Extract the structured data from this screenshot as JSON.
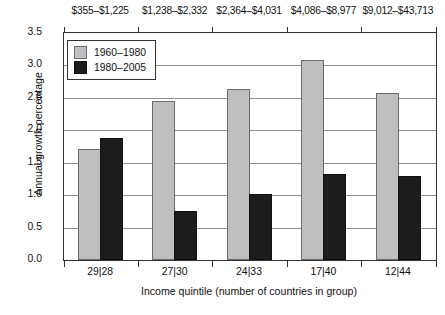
{
  "chart_data": {
    "type": "bar",
    "title": "",
    "xlabel": "Income quintile (number of countries in group)",
    "ylabel": "Annual growth percentage",
    "ylim": [
      0.0,
      3.5
    ],
    "ytick_labels": [
      "0.0",
      "0.5",
      "1.0",
      "1.5",
      "2.0",
      "2.5",
      "3.0",
      "3.5"
    ],
    "ytick_values": [
      0.0,
      0.5,
      1.0,
      1.5,
      2.0,
      2.5,
      3.0,
      3.5
    ],
    "grid": "horizontal",
    "legend_position": "upper-left-inside",
    "categories": [
      "29|28",
      "27|30",
      "24|33",
      "17|40",
      "12|44"
    ],
    "secondary_axis_label": "Income range",
    "secondary_axis_position": "top",
    "secondary_tick_labels": [
      "$355–$1,225",
      "$1,238–$2,332",
      "$2,364–$4,031",
      "$4,086–$8,977",
      "$9,012–$43,713"
    ],
    "series": [
      {
        "name": "1960–1980",
        "color": "#bfbfbf",
        "values": [
          1.68,
          2.42,
          2.6,
          3.06,
          2.55
        ]
      },
      {
        "name": "1980–2005",
        "color": "#1c1c1c",
        "values": [
          1.85,
          0.72,
          0.99,
          1.29,
          1.26
        ]
      }
    ]
  }
}
